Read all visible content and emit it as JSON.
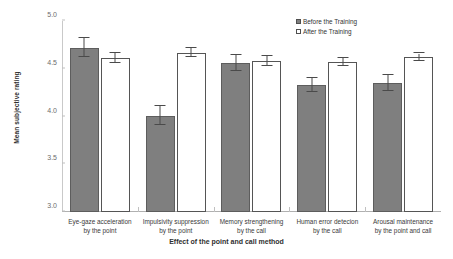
{
  "chart_data": {
    "type": "bar",
    "title": "",
    "xlabel": "Effect of the point and call method",
    "ylabel": "Mean subjective rating",
    "ylim": [
      3.0,
      5.0
    ],
    "yticks": [
      "3.0",
      "3.5",
      "4.0",
      "4.5",
      "5.0"
    ],
    "ytick_values": [
      3.0,
      3.5,
      4.0,
      4.5,
      5.0
    ],
    "grid": false,
    "legend_position": "top-right",
    "categories": [
      {
        "line1": "Eye-gaze acceleration",
        "line2": "by the point"
      },
      {
        "line1": "Impulsivity suppression",
        "line2": "by the point"
      },
      {
        "line1": "Memory strengthening",
        "line2": "by the call"
      },
      {
        "line1": "Human error detecion",
        "line2": "by the call"
      },
      {
        "line1": "Arousal maintenance",
        "line2": "by the point and call"
      }
    ],
    "series": [
      {
        "name": "Before the Training",
        "key": "before",
        "color": "#7f7f7f",
        "values": [
          4.72,
          4.01,
          4.56,
          4.33,
          4.35
        ],
        "errors": [
          0.1,
          0.1,
          0.08,
          0.07,
          0.08
        ]
      },
      {
        "name": "After the Training",
        "key": "after",
        "color": "#ffffff",
        "values": [
          4.61,
          4.67,
          4.58,
          4.57,
          4.62
        ],
        "errors": [
          0.05,
          0.05,
          0.05,
          0.04,
          0.04
        ]
      }
    ]
  },
  "legend": {
    "items": [
      {
        "label": "Before the Training",
        "style": "before"
      },
      {
        "label": "After the Training",
        "style": "after"
      }
    ]
  }
}
